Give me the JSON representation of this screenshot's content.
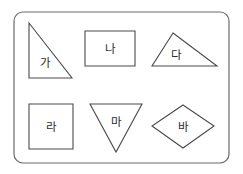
{
  "figure": {
    "title": "",
    "background_color": "#ffffff",
    "frame": {
      "name": "rounded-rectangle-border",
      "x": 14,
      "y": 12,
      "width": 215,
      "height": 151,
      "corner_radius": 9,
      "stroke_color": "#6b6b6b",
      "fill_color": "#ffffff"
    },
    "shape_stroke_color": "#4a4a4a",
    "label_color": "#2b2b2b"
  },
  "shapes": [
    {
      "label": "가",
      "name": "right-triangle-ga",
      "kind": "triangle",
      "description": "right triangle, right angle at bottom-left",
      "points": "29,23 29,78 72,78",
      "label_x": 45,
      "label_y": 63
    },
    {
      "label": "나",
      "name": "rectangle-na",
      "kind": "rectangle",
      "description": "rectangle wider than tall",
      "points": "85,31 135,31 135,66 85,66",
      "label_x": 110,
      "label_y": 49
    },
    {
      "label": "다",
      "name": "scalene-triangle-da",
      "kind": "triangle",
      "description": "obtuse scalene triangle, apex left of center",
      "points": "173,33 217,66 152,66",
      "label_x": 176,
      "label_y": 55
    },
    {
      "label": "라",
      "name": "square-ra",
      "kind": "square",
      "description": "square",
      "points": "29,104 73,104 73,149 29,149",
      "label_x": 51,
      "label_y": 127
    },
    {
      "label": "마",
      "name": "inverted-triangle-ma",
      "kind": "triangle",
      "description": "inverted isosceles triangle pointing down",
      "points": "90,104 142,104 116,152",
      "label_x": 116,
      "label_y": 122
    },
    {
      "label": "바",
      "name": "rhombus-ba",
      "kind": "rhombus",
      "description": "rhombus / diamond",
      "points": "183,105 214,126 183,148 152,126",
      "label_x": 183,
      "label_y": 127
    }
  ]
}
